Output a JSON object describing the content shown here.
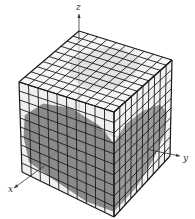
{
  "figure": {
    "grid_divisions": 10,
    "colors": {
      "grid_line": "#1a1a1a",
      "face_fill": "#f4f4f4",
      "shade_dark": "#6e6e6e",
      "shade_light": "#b8b8b8",
      "axis": "#333333"
    },
    "vertices": {
      "top_back": [
        79,
        31
      ],
      "top_left": [
        19,
        82
      ],
      "top_right": [
        172,
        60
      ],
      "top_front": [
        114,
        112
      ],
      "bottom_left": [
        22,
        172
      ],
      "bottom_front": [
        114,
        217
      ],
      "bottom_right": [
        170,
        156
      ]
    },
    "axes": {
      "x": {
        "label": "x",
        "from": [
          44,
          166
        ],
        "to": [
          14,
          188
        ],
        "label_pos": [
          8,
          192
        ]
      },
      "y": {
        "label": "y",
        "from": [
          150,
          150
        ],
        "to": [
          180,
          156
        ],
        "label_pos": [
          183,
          161
        ]
      },
      "z": {
        "label": "z",
        "from": [
          79,
          40
        ],
        "to": [
          79,
          14
        ],
        "label_pos": [
          76,
          10
        ]
      }
    }
  }
}
